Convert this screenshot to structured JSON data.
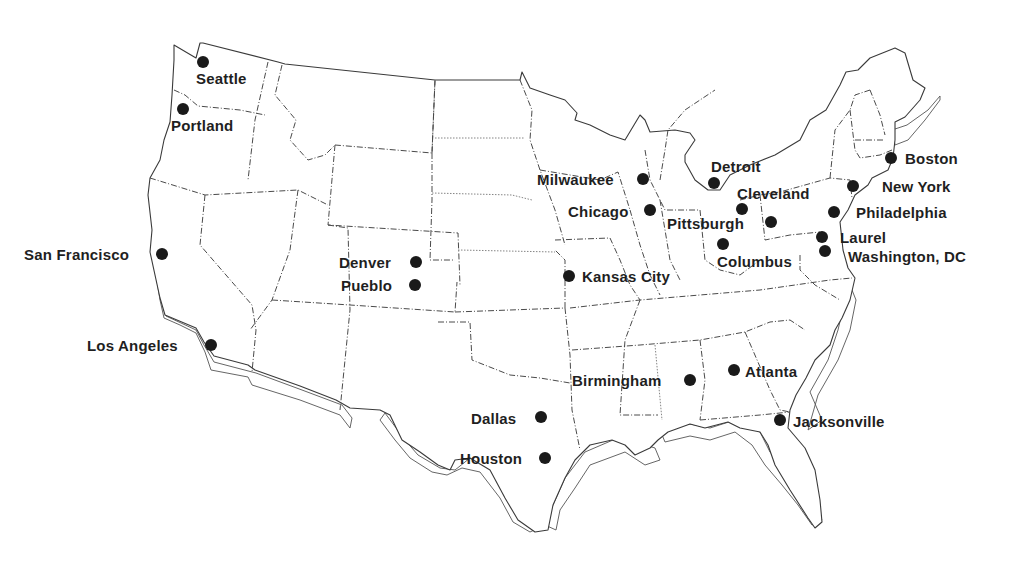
{
  "map": {
    "title": "",
    "type": "US city map (contiguous states, state borders)",
    "colors": {
      "background": "#ffffff",
      "ink": "#1f1f1f",
      "border": "#4a4a4a"
    },
    "cities": [
      {
        "name": "Seattle",
        "dot": [
          203,
          62
        ],
        "label": [
          196,
          70
        ],
        "anchor": "left"
      },
      {
        "name": "Portland",
        "dot": [
          183,
          109
        ],
        "label": [
          171,
          117
        ],
        "anchor": "left"
      },
      {
        "name": "San Francisco",
        "dot": [
          162,
          254
        ],
        "label": [
          24,
          246
        ],
        "anchor": "left"
      },
      {
        "name": "Los Angeles",
        "dot": [
          211,
          345
        ],
        "label": [
          87,
          337
        ],
        "anchor": "left"
      },
      {
        "name": "Denver",
        "dot": [
          416,
          262
        ],
        "label": [
          339,
          254
        ],
        "anchor": "left"
      },
      {
        "name": "Pueblo",
        "dot": [
          415,
          285
        ],
        "label": [
          341,
          277
        ],
        "anchor": "left"
      },
      {
        "name": "Dallas",
        "dot": [
          541,
          417
        ],
        "label": [
          471,
          410
        ],
        "anchor": "left"
      },
      {
        "name": "Houston",
        "dot": [
          545,
          458
        ],
        "label": [
          460,
          450
        ],
        "anchor": "left"
      },
      {
        "name": "Kansas City",
        "dot": [
          569,
          276
        ],
        "label": [
          582,
          268
        ],
        "anchor": "left"
      },
      {
        "name": "Milwaukee",
        "dot": [
          643,
          179
        ],
        "label": [
          537,
          171
        ],
        "anchor": "left"
      },
      {
        "name": "Chicago",
        "dot": [
          650,
          210
        ],
        "label": [
          568,
          203
        ],
        "anchor": "left"
      },
      {
        "name": "Detroit",
        "dot": [
          714,
          183
        ],
        "label": [
          711,
          158
        ],
        "anchor": "left"
      },
      {
        "name": "Cleveland",
        "dot": [
          742,
          209
        ],
        "label": [
          737,
          185
        ],
        "anchor": "left"
      },
      {
        "name": "Pittsburgh",
        "dot": [
          771,
          222
        ],
        "label": [
          667,
          215
        ],
        "anchor": "left"
      },
      {
        "name": "Columbus",
        "dot": [
          723,
          244
        ],
        "label": [
          717,
          253
        ],
        "anchor": "left"
      },
      {
        "name": "Birmingham",
        "dot": [
          690,
          380
        ],
        "label": [
          572,
          372
        ],
        "anchor": "left"
      },
      {
        "name": "Atlanta",
        "dot": [
          734,
          370
        ],
        "label": [
          745,
          363
        ],
        "anchor": "left"
      },
      {
        "name": "Jacksonville",
        "dot": [
          780,
          420
        ],
        "label": [
          793,
          413
        ],
        "anchor": "left"
      },
      {
        "name": "Boston",
        "dot": [
          891,
          158
        ],
        "label": [
          905,
          150
        ],
        "anchor": "left"
      },
      {
        "name": "New York",
        "dot": [
          853,
          186
        ],
        "label": [
          882,
          178
        ],
        "anchor": "left"
      },
      {
        "name": "Philadelphia",
        "dot": [
          834,
          212
        ],
        "label": [
          856,
          204
        ],
        "anchor": "left"
      },
      {
        "name": "Laurel",
        "dot": [
          822,
          237
        ],
        "label": [
          840,
          229
        ],
        "anchor": "left"
      },
      {
        "name": "Washington, DC",
        "dot": [
          825,
          251
        ],
        "label": [
          848,
          248
        ],
        "anchor": "left"
      }
    ]
  }
}
